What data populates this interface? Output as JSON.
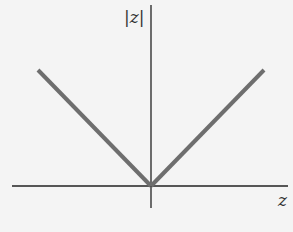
{
  "chart_data": {
    "type": "line",
    "title": "",
    "xlabel": "z",
    "ylabel": "|z|",
    "function": "abs",
    "series": [
      {
        "name": "|z|",
        "x": [
          -1,
          0,
          1
        ],
        "y": [
          1,
          0,
          1
        ]
      }
    ],
    "xlim": [
      -1.22,
      1.22
    ],
    "ylim": [
      -0.2,
      1.6
    ],
    "grid": false,
    "legend": "none",
    "colors": {
      "curve": "#6e6e6e",
      "axes": "#222222",
      "background": "#f4f4f4"
    }
  }
}
